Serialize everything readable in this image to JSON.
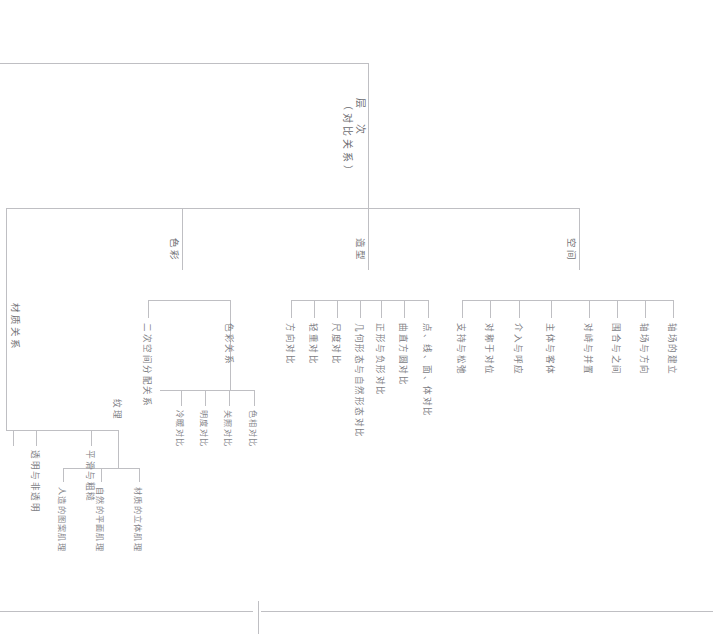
{
  "diagram": {
    "orientation": "rotated-90-clockwise",
    "root": {
      "label": "层　次",
      "sublabel": "（对比关系）",
      "full": "层　次（对比关系）"
    },
    "branches": [
      {
        "key": "space",
        "label": "空间",
        "children": [
          {
            "label": "轴场的建立"
          },
          {
            "label": "轴场与方向"
          },
          {
            "label": "围合与之间"
          },
          {
            "label": "对峙与并置"
          },
          {
            "label": "主体与客体"
          },
          {
            "label": "介入与呼应"
          },
          {
            "label": "对称于对位"
          },
          {
            "label": "支持与松弛"
          }
        ]
      },
      {
        "key": "form",
        "label": "造型",
        "children": [
          {
            "label": "点、线、面、体对比"
          },
          {
            "label": "曲直方圆对比"
          },
          {
            "label": "正形与负形对比"
          },
          {
            "label": "几何形态与自然形态对比"
          },
          {
            "label": "尺度对比"
          },
          {
            "label": "轻重对比"
          },
          {
            "label": "方向对比"
          }
        ]
      },
      {
        "key": "color",
        "label": "色彩",
        "children": [
          {
            "label": "二次空间分配关系"
          },
          {
            "label": "色彩关系",
            "children": [
              {
                "label": "色相对比"
              },
              {
                "label": "关照对比"
              },
              {
                "label": "明度对比"
              },
              {
                "label": "冷暖对比"
              }
            ]
          }
        ]
      },
      {
        "key": "material",
        "label": "材质关系",
        "children": [
          {
            "label": "纹理",
            "children": [
              {
                "label": "材质的立体肌理"
              },
              {
                "label": "自然的平面肌理"
              },
              {
                "label": "人造的图案肌理"
              }
            ]
          },
          {
            "label": "平滑与粗糙"
          },
          {
            "label": "透明与非透明"
          }
        ]
      }
    ],
    "colors": {
      "line": "#bfbfc3",
      "text": "#7a7a7e",
      "background": "#ffffff"
    }
  }
}
